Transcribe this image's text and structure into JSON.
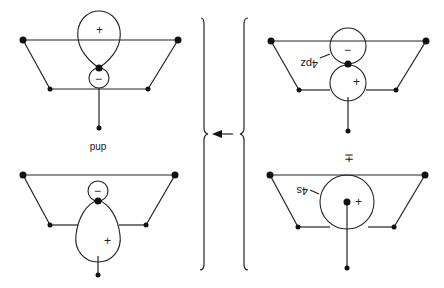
{
  "panels": [
    {
      "id": "top-left",
      "signs": [
        "+",
        "−"
      ]
    },
    {
      "id": "bottom-left",
      "signs": [
        "−",
        "+"
      ],
      "label": "pup"
    },
    {
      "id": "top-right",
      "signs": [
        "−",
        "+"
      ],
      "orbital_label": "4pz"
    },
    {
      "id": "bottom-right",
      "signs": [
        "+"
      ],
      "orbital_label": "4s",
      "above_label": "+̄"
    }
  ],
  "labels": {
    "pup": "pup",
    "plus": "+",
    "minus": "−",
    "four_pz": "4pz",
    "four_s": "4s",
    "plus_bar": "∓"
  },
  "arrow": {
    "direction": "left"
  }
}
